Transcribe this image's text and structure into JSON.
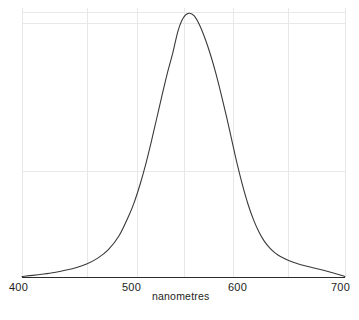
{
  "chart_data": {
    "type": "line",
    "title": "",
    "subtitle": "",
    "xlabel": "nanometres",
    "ylabel": "",
    "xlim": [
      400,
      700
    ],
    "ylim": [
      0,
      1
    ],
    "xticks": [
      400,
      500,
      600,
      700
    ],
    "xtick_labels": [
      "400",
      "500",
      "600",
      "700"
    ],
    "yticks": [],
    "ytick_labels": [],
    "grid": true,
    "grid_x_values": [
      400,
      460,
      507,
      550,
      596,
      647,
      700
    ],
    "grid_y_values": [
      0.0,
      0.4,
      0.96,
      1.0
    ],
    "legend": null,
    "legend_position": "none",
    "annotations": [],
    "series": [
      {
        "name": "spectral sensitivity",
        "color": "#3a3a3a",
        "line_width": 1.1,
        "x": [
          400,
          410,
          420,
          430,
          440,
          450,
          460,
          470,
          480,
          490,
          500,
          505,
          510,
          515,
          520,
          525,
          530,
          535,
          540,
          545,
          550,
          555,
          560,
          565,
          570,
          575,
          580,
          585,
          590,
          595,
          600,
          605,
          610,
          615,
          620,
          625,
          630,
          635,
          640,
          650,
          660,
          670,
          680,
          690,
          700
        ],
        "y": [
          0.004,
          0.008,
          0.013,
          0.019,
          0.027,
          0.037,
          0.051,
          0.072,
          0.104,
          0.156,
          0.24,
          0.292,
          0.355,
          0.428,
          0.51,
          0.597,
          0.685,
          0.77,
          0.845,
          0.93,
          0.979,
          0.995,
          0.985,
          0.95,
          0.9,
          0.84,
          0.77,
          0.69,
          0.605,
          0.515,
          0.425,
          0.345,
          0.275,
          0.218,
          0.172,
          0.137,
          0.112,
          0.093,
          0.079,
          0.06,
          0.047,
          0.037,
          0.027,
          0.016,
          0.004
        ]
      }
    ]
  },
  "axes": {
    "x_axis_line_color": "#2b2b2b",
    "grid_color": "#e8e8e8",
    "background": "#ffffff"
  },
  "labels": {
    "x_ticks": [
      "400",
      "500",
      "600",
      "700"
    ],
    "x_title": "nanometres"
  }
}
